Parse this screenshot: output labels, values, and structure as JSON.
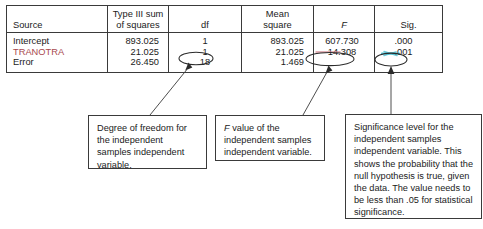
{
  "table": {
    "headers": [
      {
        "id": "source",
        "label": "Source",
        "italic": false
      },
      {
        "id": "type3ss",
        "line1": "Type III sum",
        "line2": "of squares",
        "italic": false
      },
      {
        "id": "df",
        "label": "df",
        "italic": false
      },
      {
        "id": "meansquare",
        "line1": "Mean",
        "line2": "square",
        "italic": false
      },
      {
        "id": "f",
        "label": "F",
        "italic": true
      },
      {
        "id": "sig",
        "label": "Sig.",
        "italic": false
      }
    ],
    "rows": [
      {
        "source": "Intercept",
        "source_color": "#1b1b1b",
        "type3_sum_of_squares": "893.025",
        "df": "1",
        "mean_square": "893.025",
        "f": "607.730",
        "sig": ".000"
      },
      {
        "source": "TRANOTRA",
        "source_color": "#a8484d",
        "type3_sum_of_squares": "21.025",
        "df": "1",
        "mean_square": "21.025",
        "f": "14.308",
        "sig": ".001"
      },
      {
        "source": "Error",
        "source_color": "#1b1b1b",
        "type3_sum_of_squares": "26.450",
        "df": "18",
        "mean_square": "1.469",
        "f": "",
        "sig": ""
      }
    ]
  },
  "annotations": {
    "circled_values": [
      {
        "name": "df-circle",
        "value": "1"
      },
      {
        "name": "f-circle",
        "value": "14.308"
      },
      {
        "name": "sig-circle",
        "value": ".001"
      }
    ],
    "highlight_color": "#35b5c9",
    "line_color": "#3a3a3a"
  },
  "callouts": [
    {
      "id": "callout-df",
      "text": "Degree of freedom for the independent samples independent variable."
    },
    {
      "id": "callout-f",
      "lead_italic": "F",
      "text": " value of the independent samples independent variable."
    },
    {
      "id": "callout-sig",
      "text": "Significance level for the independent samples independent variable. This shows the probability that the null hypothesis is true, given the data. The value needs to be less than .05 for statistical significance."
    }
  ]
}
